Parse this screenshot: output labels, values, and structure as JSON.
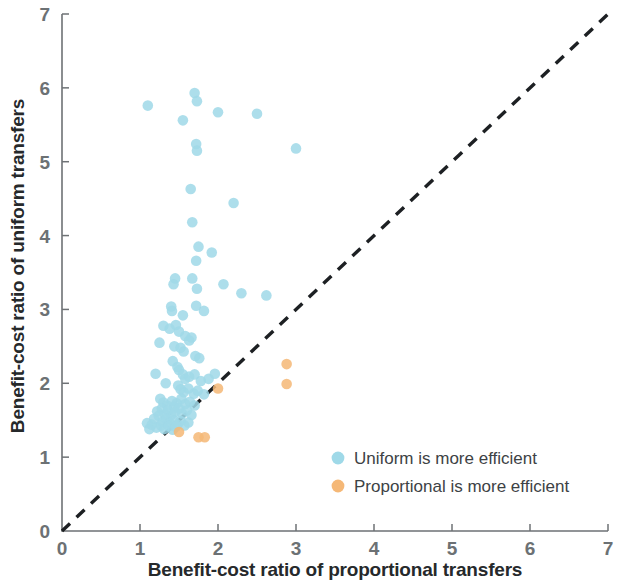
{
  "chart_data": {
    "type": "scatter",
    "title": "",
    "xlabel": "Benefit-cost ratio of proportional transfers",
    "ylabel": "Benefit-cost ratio of uniform transfers",
    "xlim": [
      0,
      7
    ],
    "ylim": [
      0,
      7
    ],
    "xticks": [
      "0",
      "1",
      "2",
      "3",
      "4",
      "5",
      "6",
      "7"
    ],
    "yticks": [
      "0",
      "1",
      "2",
      "3",
      "4",
      "5",
      "6",
      "7"
    ],
    "grid": false,
    "legend_position": "inside-lower-right",
    "annotations": [
      {
        "name": "identity-line",
        "type": "dashed-line",
        "from": [
          0,
          0
        ],
        "to": [
          7,
          7
        ],
        "color": "#1d2023"
      }
    ],
    "series": [
      {
        "name": "Uniform is more efficient",
        "color": "#9fd9e8",
        "marker": "circle",
        "points": [
          [
            1.1,
            5.76
          ],
          [
            1.55,
            5.56
          ],
          [
            1.7,
            5.93
          ],
          [
            1.73,
            5.82
          ],
          [
            2.0,
            5.67
          ],
          [
            2.5,
            5.65
          ],
          [
            1.72,
            5.24
          ],
          [
            1.73,
            5.15
          ],
          [
            3.0,
            5.18
          ],
          [
            1.65,
            4.63
          ],
          [
            2.2,
            4.44
          ],
          [
            1.67,
            4.18
          ],
          [
            1.75,
            3.85
          ],
          [
            1.72,
            3.66
          ],
          [
            1.92,
            3.77
          ],
          [
            1.45,
            3.42
          ],
          [
            1.43,
            3.34
          ],
          [
            1.67,
            3.42
          ],
          [
            1.73,
            3.28
          ],
          [
            2.07,
            3.34
          ],
          [
            2.3,
            3.22
          ],
          [
            2.62,
            3.19
          ],
          [
            1.4,
            3.04
          ],
          [
            1.41,
            2.98
          ],
          [
            1.55,
            2.92
          ],
          [
            1.72,
            3.05
          ],
          [
            1.82,
            2.98
          ],
          [
            1.3,
            2.78
          ],
          [
            1.38,
            2.74
          ],
          [
            1.46,
            2.79
          ],
          [
            1.5,
            2.7
          ],
          [
            1.58,
            2.64
          ],
          [
            1.66,
            2.62
          ],
          [
            1.25,
            2.55
          ],
          [
            1.44,
            2.5
          ],
          [
            1.52,
            2.48
          ],
          [
            1.56,
            2.43
          ],
          [
            1.63,
            2.58
          ],
          [
            1.71,
            2.37
          ],
          [
            1.76,
            2.34
          ],
          [
            1.42,
            2.3
          ],
          [
            1.2,
            2.13
          ],
          [
            1.48,
            2.22
          ],
          [
            1.5,
            2.18
          ],
          [
            1.55,
            2.12
          ],
          [
            1.58,
            2.06
          ],
          [
            1.63,
            2.09
          ],
          [
            1.7,
            2.12
          ],
          [
            1.78,
            2.03
          ],
          [
            1.88,
            2.06
          ],
          [
            1.96,
            2.13
          ],
          [
            1.33,
            2.0
          ],
          [
            1.49,
            1.97
          ],
          [
            1.52,
            1.92
          ],
          [
            1.56,
            1.88
          ],
          [
            1.62,
            1.93
          ],
          [
            1.69,
            1.86
          ],
          [
            1.74,
            1.9
          ],
          [
            1.82,
            1.85
          ],
          [
            1.26,
            1.79
          ],
          [
            1.3,
            1.74
          ],
          [
            1.35,
            1.7
          ],
          [
            1.41,
            1.76
          ],
          [
            1.44,
            1.68
          ],
          [
            1.47,
            1.73
          ],
          [
            1.53,
            1.79
          ],
          [
            1.58,
            1.72
          ],
          [
            1.64,
            1.75
          ],
          [
            1.7,
            1.7
          ],
          [
            1.22,
            1.62
          ],
          [
            1.28,
            1.66
          ],
          [
            1.32,
            1.58
          ],
          [
            1.36,
            1.63
          ],
          [
            1.4,
            1.57
          ],
          [
            1.45,
            1.61
          ],
          [
            1.5,
            1.66
          ],
          [
            1.54,
            1.59
          ],
          [
            1.6,
            1.63
          ],
          [
            1.66,
            1.57
          ],
          [
            1.18,
            1.52
          ],
          [
            1.24,
            1.56
          ],
          [
            1.29,
            1.48
          ],
          [
            1.34,
            1.52
          ],
          [
            1.38,
            1.46
          ],
          [
            1.43,
            1.5
          ],
          [
            1.48,
            1.44
          ],
          [
            1.52,
            1.49
          ],
          [
            1.57,
            1.43
          ],
          [
            1.62,
            1.47
          ],
          [
            1.15,
            1.44
          ],
          [
            1.21,
            1.4
          ],
          [
            1.27,
            1.43
          ],
          [
            1.31,
            1.38
          ],
          [
            1.37,
            1.42
          ],
          [
            1.42,
            1.37
          ],
          [
            1.46,
            1.41
          ],
          [
            1.09,
            1.46
          ],
          [
            1.12,
            1.38
          ]
        ]
      },
      {
        "name": "Proportional is more efficient",
        "color": "#f5b877",
        "marker": "circle",
        "points": [
          [
            2.0,
            1.93
          ],
          [
            2.88,
            2.26
          ],
          [
            2.88,
            1.99
          ],
          [
            1.5,
            1.34
          ],
          [
            1.75,
            1.27
          ],
          [
            1.83,
            1.27
          ]
        ]
      }
    ]
  },
  "legend": {
    "items": [
      {
        "label": "Uniform is more efficient",
        "color": "#9fd9e8"
      },
      {
        "label": "Proportional is more efficient",
        "color": "#f5b877"
      }
    ]
  },
  "axes": {
    "x_title": "Benefit-cost ratio of proportional transfers",
    "y_title": "Benefit-cost ratio of uniform transfers"
  }
}
